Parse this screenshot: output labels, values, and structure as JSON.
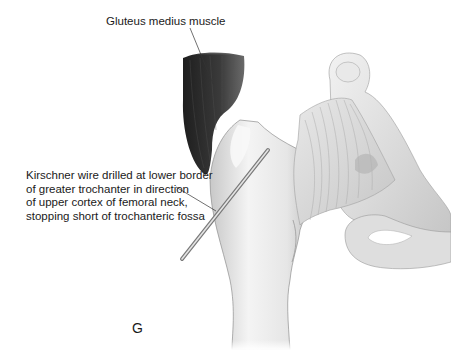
{
  "figure": {
    "panel_letter": "G",
    "labels": {
      "gluteus_medius": "Gluteus medius muscle",
      "kirschner_wire": [
        "Kirschner wire drilled at lower border",
        "of greater trochanter in direction",
        "of upper cortex of femoral neck,",
        "stopping short of trochanteric fossa"
      ]
    },
    "colors": {
      "background": "#ffffff",
      "text": "#1a1a1a",
      "bone_light": "#f2f2f2",
      "bone_shade": "#bdbdbd",
      "muscle_dark": "#2a2a2a",
      "tendon": "#d9d9d9"
    }
  }
}
